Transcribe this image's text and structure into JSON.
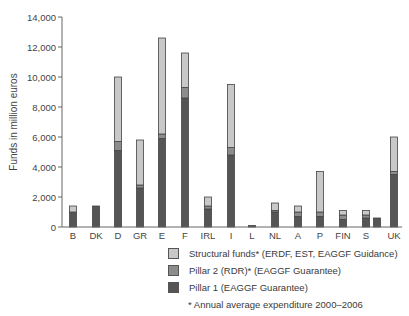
{
  "chart_data": {
    "type": "bar",
    "stacked": true,
    "title": "",
    "xlabel": "",
    "ylabel": "Funds in  million euros",
    "ylim": [
      0,
      14000
    ],
    "yticks": [
      0,
      2000,
      4000,
      6000,
      8000,
      10000,
      12000,
      14000
    ],
    "ytick_labels": [
      "0",
      "2,000",
      "4,000",
      "6,000",
      "8,000",
      "10,000",
      "12,000",
      "14,000"
    ],
    "grid": false,
    "categories": [
      "B",
      "DK",
      "D",
      "GR",
      "E",
      "F",
      "IRL",
      "I",
      "L",
      "NL",
      "A",
      "P",
      "FIN",
      "S",
      "",
      "UK"
    ],
    "series": [
      {
        "name": "Pillar 1 (EAGGF Guarantee)",
        "color": "#555555",
        "values": [
          1000,
          1400,
          5100,
          2600,
          5900,
          8600,
          1200,
          4800,
          100,
          1000,
          700,
          700,
          500,
          600,
          600,
          3500
        ]
      },
      {
        "name": "Pillar 2 (RDR)* (EAGGF Guarantee)",
        "color": "#8c8c8c",
        "values": [
          0,
          0,
          600,
          200,
          300,
          700,
          200,
          500,
          0,
          100,
          300,
          300,
          300,
          200,
          0,
          200
        ]
      },
      {
        "name": "Structural funds* (ERDF, EST, EAGGF Guidance)",
        "color": "#c8c8c8",
        "values": [
          400,
          0,
          4300,
          3000,
          6400,
          2300,
          600,
          4200,
          0,
          500,
          400,
          2700,
          300,
          300,
          0,
          2300
        ]
      }
    ],
    "legend_position": "bottom-right",
    "annotation": "* Annual average expenditure  2000–2006"
  },
  "legend": {
    "items": [
      {
        "label": "Structural funds* (ERDF, EST, EAGGF Guidance)",
        "color": "#c8c8c8"
      },
      {
        "label": "Pillar 2 (RDR)* (EAGGF Guarantee)",
        "color": "#8c8c8c"
      },
      {
        "label": "Pillar 1 (EAGGF Guarantee)",
        "color": "#555555"
      }
    ],
    "note": "* Annual average expenditure  2000–2006"
  }
}
